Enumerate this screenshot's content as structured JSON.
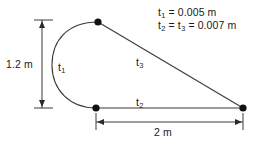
{
  "figure": {
    "background_color": "#ffffff",
    "stroke_color": "#3a3a3a",
    "node_color": "#111111",
    "text_color": "#1a1a1a"
  },
  "notes": {
    "line1_base": "t",
    "line1_sub": "1",
    "line1_rest": " = 0.005 m",
    "line2_base": "t",
    "line2_sub": "2",
    "line2_mid_base": "t",
    "line2_mid_sub": "3",
    "line2_rest": " = 0.007 m",
    "line1_full": "t1 = 0.005 m",
    "line2_full": "t2 = t3 = 0.007 m"
  },
  "dimensions": {
    "vertical_label": "1.2 m",
    "vertical_value": 1.2,
    "vertical_unit": "m",
    "horizontal_label": "2 m",
    "horizontal_value": 2,
    "horizontal_unit": "m"
  },
  "segments": [
    {
      "id": "t1",
      "base": "t",
      "subscript": "1",
      "label": "t1",
      "kind": "semicircular-arc",
      "thickness": "0.005 m",
      "thickness_value": 0.005
    },
    {
      "id": "t2",
      "base": "t",
      "subscript": "2",
      "label": "t2",
      "kind": "horizontal-line",
      "thickness": "0.007 m",
      "thickness_value": 0.007
    },
    {
      "id": "t3",
      "base": "t",
      "subscript": "3",
      "label": "t3",
      "kind": "diagonal-line",
      "thickness": "0.007 m",
      "thickness_value": 0.007
    }
  ],
  "nodes": [
    {
      "id": "node-top",
      "x": 98,
      "y": 22
    },
    {
      "id": "node-bottom-left",
      "x": 96,
      "y": 108
    },
    {
      "id": "node-right",
      "x": 243,
      "y": 108
    }
  ],
  "geometry": {
    "arc_leftmost_x": 52,
    "vertical_dim_x": 42,
    "vertical_dim_top_y": 20,
    "vertical_dim_bottom_y": 108,
    "horizontal_dim_y": 122,
    "horizontal_dim_left_x": 96,
    "horizontal_dim_right_x": 243
  }
}
